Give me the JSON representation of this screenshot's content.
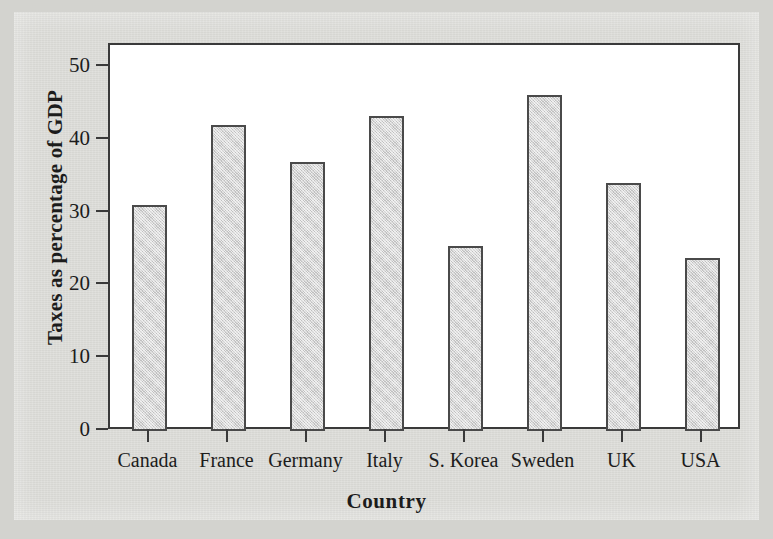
{
  "chart_data": {
    "type": "bar",
    "title": "",
    "subtitle": "",
    "xlabel": "Country",
    "ylabel": "Taxes as percentage of GDP",
    "categories": [
      "Canada",
      "France",
      "Germany",
      "Italy",
      "S. Korea",
      "Sweden",
      "UK",
      "USA"
    ],
    "values": [
      31.0,
      42.0,
      37.0,
      43.3,
      25.4,
      46.2,
      34.1,
      23.7
    ],
    "ylim": [
      0,
      53
    ],
    "xlim": [
      0,
      8
    ],
    "yticks": [
      0,
      10,
      20,
      30,
      40,
      50
    ],
    "ytick_labels": [
      "0",
      "10",
      "20",
      "30",
      "40",
      "50"
    ],
    "grid": false,
    "legend": false,
    "legend_position": "none",
    "series": [
      {
        "name": "Taxes as percentage of GDP",
        "values": [
          31.0,
          42.0,
          37.0,
          43.3,
          25.4,
          46.2,
          34.1,
          23.7
        ]
      }
    ],
    "annotations": []
  },
  "style": {
    "page_background": "#d3d3cf",
    "plot_background": "#ffffff",
    "axis_color": "#3a3a3a",
    "bar_fill": "#d2d2d2",
    "bar_stroke": "#4a4a4a",
    "text_color": "#1c1c1c"
  }
}
